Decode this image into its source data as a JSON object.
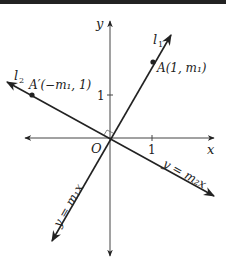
{
  "diagram": {
    "axes": {
      "x_label": "x",
      "y_label": "y",
      "origin_label": "O",
      "x_tick_label": "1",
      "y_tick_label": "1"
    },
    "lines": [
      {
        "name": "l1",
        "label": "l",
        "subscript": "1",
        "equation": "y = m₁x"
      },
      {
        "name": "l2",
        "label": "l",
        "subscript": "2",
        "equation": "y = m₂x"
      }
    ],
    "points": [
      {
        "name": "A",
        "label": "A(1, m₁)"
      },
      {
        "name": "A_prime",
        "label": "A′(−m₁, 1)"
      }
    ],
    "right_angle_marker": true,
    "colors": {
      "line": "#222222",
      "axis": "#444444",
      "topbar": "#222222"
    }
  }
}
